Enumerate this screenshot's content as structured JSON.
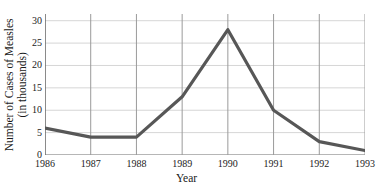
{
  "chart_data": {
    "type": "line",
    "title": "",
    "xlabel": "Year",
    "ylabel": "Number of Cases of Measles (in thousands)",
    "ylabel_line1": "Number of Cases of Measles",
    "ylabel_line2": "(in thousands)",
    "categories": [
      "1986",
      "1987",
      "1988",
      "1989",
      "1990",
      "1991",
      "1992",
      "1993"
    ],
    "x": [
      1986,
      1987,
      1988,
      1989,
      1990,
      1991,
      1992,
      1993
    ],
    "values": [
      6,
      4,
      4,
      13,
      28,
      10,
      3,
      1
    ],
    "series": [
      {
        "name": "Measles cases",
        "values": [
          6,
          4,
          4,
          13,
          28,
          10,
          3,
          1
        ]
      }
    ],
    "xtick_labels": [
      "1986",
      "1987",
      "1988",
      "1989",
      "1990",
      "1991",
      "1992",
      "1993"
    ],
    "ytick_labels": [
      "0",
      "5",
      "10",
      "15",
      "20",
      "25",
      "30"
    ],
    "ytick_values": [
      0,
      5,
      10,
      15,
      20,
      25,
      30
    ],
    "xlim": [
      1986,
      1993
    ],
    "ylim": [
      0,
      31.5
    ],
    "grid": "both",
    "legend": "none",
    "line_color": "#575757",
    "grid_color_horizontal": "#d6d6d6",
    "grid_color_vertical": "#9a9a9a",
    "axis_color": "#6e6e6e"
  }
}
